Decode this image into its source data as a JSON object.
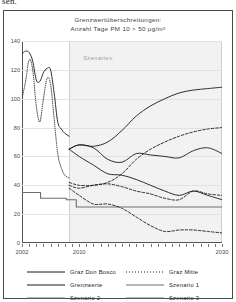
{
  "page": {
    "cut_off_text": "sen."
  },
  "figure": {
    "title_line1": "Grenzwertüberschreitungen:",
    "title_line2": "Anzahl Tage PM 10 > 50 µg/m³",
    "band_label": "Szenarien"
  },
  "chart_data": {
    "type": "line",
    "title": "Grenzwertüberschreitungen: Anzahl Tage PM 10 > 50 µg/m³",
    "xlabel": "",
    "ylabel": "Anzahl Tage PM 10 > 50 µg/m³",
    "xlim": [
      2002,
      2030
    ],
    "ylim": [
      0,
      140
    ],
    "yticks": [
      0,
      20,
      40,
      60,
      80,
      100,
      120,
      140
    ],
    "xticks": [
      2002,
      2010,
      2030
    ],
    "xtick_labels": [
      "2002",
      "2010",
      "2030"
    ],
    "grid": true,
    "legend_position": "bottom",
    "annotations": [
      {
        "text": "Szenarien",
        "x_start": 2008.6,
        "x_end": 2030,
        "note": "shaded scenario region from 2008.6 onward"
      }
    ],
    "series": [
      {
        "name": "Graz Don Bosco",
        "style": "solid",
        "color": "#1a1a1a",
        "x": [
          2002,
          2002.5,
          2003,
          2003.5,
          2004,
          2004.5,
          2005,
          2005.5,
          2006,
          2006.5,
          2007,
          2007.5,
          2008,
          2008.6
        ],
        "values": [
          131,
          133,
          132,
          126,
          113,
          112,
          118,
          121,
          120,
          104,
          84,
          79,
          76,
          74
        ]
      },
      {
        "name": "Graz Mitte",
        "style": "dotted",
        "color": "#1a1a1a",
        "x": [
          2002,
          2002.5,
          2003,
          2003.5,
          2004,
          2004.5,
          2005,
          2005.5,
          2006,
          2006.5,
          2007,
          2007.5,
          2008,
          2008.6
        ],
        "values": [
          100,
          112,
          127,
          120,
          95,
          84,
          100,
          114,
          110,
          86,
          62,
          52,
          47,
          45
        ]
      },
      {
        "name": "Grenzwerte",
        "style": "solid",
        "color": "#6e6e6e",
        "x": [
          2002,
          2004.6,
          2004.6,
          2008.2,
          2008.2,
          2009.6,
          2009.6,
          2030
        ],
        "values": [
          35,
          35,
          31,
          31,
          30,
          30,
          25,
          25
        ],
        "note": "step function limit values 35 -> 31 -> 30 -> 25"
      },
      {
        "name": "Szenario 1",
        "style": "solid",
        "color": "#1a1a1a",
        "x": [
          2008.6,
          2010,
          2012,
          2014,
          2016,
          2018,
          2020,
          2022,
          2024,
          2026,
          2028,
          2030
        ],
        "values": [
          65,
          68,
          67,
          70,
          78,
          88,
          95,
          100,
          104,
          106,
          107,
          108
        ]
      },
      {
        "name": "Szenario 2",
        "style": "solid",
        "color": "#1a1a1a",
        "x": [
          2008.6,
          2010,
          2012,
          2014,
          2016,
          2018,
          2020,
          2022,
          2024,
          2026,
          2028,
          2030
        ],
        "values": [
          65,
          68,
          66,
          58,
          56,
          62,
          61,
          60,
          59,
          64,
          66,
          62
        ]
      },
      {
        "name": "Szenario 3",
        "style": "solid",
        "color": "#1a1a1a",
        "x": [
          2008.6,
          2010,
          2012,
          2014,
          2016,
          2018,
          2020,
          2022,
          2024,
          2026,
          2028,
          2030
        ],
        "values": [
          65,
          60,
          54,
          48,
          47,
          44,
          40,
          36,
          33,
          36,
          33,
          30
        ]
      },
      {
        "name": "Szenario 1 (dashed variant)",
        "style": "dashed",
        "color": "#1a1a1a",
        "x": [
          2008.6,
          2010,
          2012,
          2014,
          2016,
          2018,
          2020,
          2022,
          2024,
          2026,
          2028,
          2030
        ],
        "values": [
          42,
          40,
          40,
          42,
          48,
          58,
          65,
          70,
          74,
          77,
          79,
          80
        ]
      },
      {
        "name": "Szenario 2 (dashed variant)",
        "style": "dashed",
        "color": "#1a1a1a",
        "x": [
          2008.6,
          2010,
          2012,
          2014,
          2016,
          2018,
          2020,
          2022,
          2024,
          2026,
          2028,
          2030
        ],
        "values": [
          40,
          38,
          40,
          41,
          39,
          36,
          34,
          31,
          30,
          36,
          34,
          33
        ]
      },
      {
        "name": "Szenario 3 (dashed variant)",
        "style": "dashed",
        "color": "#1a1a1a",
        "x": [
          2008.6,
          2010,
          2012,
          2014,
          2016,
          2018,
          2020,
          2022,
          2024,
          2026,
          2028,
          2030
        ],
        "values": [
          38,
          33,
          27,
          27,
          24,
          18,
          12,
          8,
          9,
          9,
          8,
          7
        ]
      }
    ]
  },
  "legend": {
    "items": [
      {
        "label": "Graz Don Bosco",
        "style": "solid",
        "color": "#1a1a1a"
      },
      {
        "label": "Graz Mitte",
        "style": "dotted",
        "color": "#1a1a1a"
      },
      {
        "label": "Grenzwerte",
        "style": "solid",
        "color": "#1a1a1a"
      },
      {
        "label": "Szenario 1",
        "style": "solid",
        "color": "#6e6e6e"
      },
      {
        "label": "Szenario 2",
        "style": "solid",
        "color": "#6e6e6e"
      },
      {
        "label": "Szenario 3",
        "style": "solid",
        "color": "#6e6e6e"
      }
    ]
  }
}
